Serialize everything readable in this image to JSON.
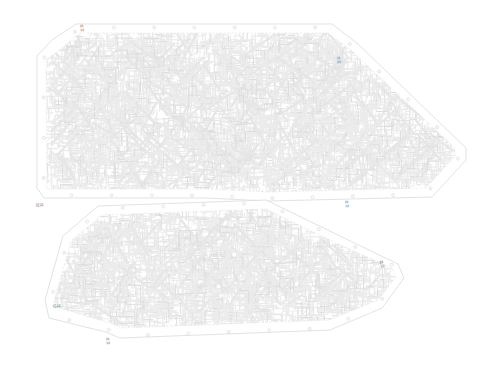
{
  "document": {
    "type": "technical-cad-drawing",
    "subject": "two overlapping chamfered polygon panels with dense routed trace fill",
    "background_color": "#ffffff",
    "width": 481,
    "height": 368
  },
  "palette": {
    "background": "#ffffff",
    "outline": "#d6d6d6",
    "inner_outline": "#e0e0e0",
    "trace_light": "#ebebeb",
    "trace_mid": "#e6e6e6",
    "trace_fine": "#efefef",
    "trace_dark": "#dedede",
    "marker": "#cfcfcf",
    "text": "#8a8a8a"
  },
  "panels": [
    {
      "id": "panel-upper",
      "name": "upper-panel",
      "outline_points": "52,40 76,24 332,24 358,44 466,148 466,160 432,197 268,201 206,198 44,198 37,188 37,56",
      "inner_points": "62,48 80,33 328,33 352,51 455,148 455,156 426,188 268,192 208,189 47,189 46,60",
      "band_markers_count": 26
    },
    {
      "id": "panel-lower",
      "name": "lower-panel",
      "outline_points": "266,200 340,236 398,264 404,278 382,308 330,330 120,338 106,332 49,318 45,300 63,236 98,206",
      "inner_points": "266,209 336,243 392,268 396,277 378,300 329,320 122,328 110,323 56,307 54,301 71,241 102,215",
      "band_markers_count": 20
    }
  ],
  "annotations": [
    {
      "id": "ann-top-left",
      "name": "dimension-label-top-left",
      "line1": "21",
      "line2": "12",
      "x": 82,
      "y": 29,
      "rotation": -4
    },
    {
      "id": "ann-top-right",
      "name": "dimension-label-top-right",
      "line1": "11",
      "line2": "22",
      "x": 339,
      "y": 61,
      "rotation": -4
    },
    {
      "id": "ann-left-mid",
      "name": "dimension-label-left-middle",
      "line1": "21",
      "line2": "11",
      "x": 41,
      "y": 205,
      "rotation": -90
    },
    {
      "id": "ann-mid-right",
      "name": "dimension-label-middle-right",
      "line1": "21",
      "line2": "12",
      "x": 347,
      "y": 205,
      "rotation": -4
    },
    {
      "id": "ann-low-right",
      "name": "dimension-label-lower-right",
      "line1": "22",
      "line2": "11",
      "x": 382,
      "y": 265,
      "rotation": -16
    },
    {
      "id": "ann-low-left",
      "name": "dimension-label-lower-left",
      "line1": "21",
      "line2": "11",
      "x": 58,
      "y": 306,
      "rotation": -90
    },
    {
      "id": "ann-bottom",
      "name": "dimension-label-bottom",
      "line1": "21",
      "line2": "12",
      "x": 108,
      "y": 342,
      "rotation": -4
    }
  ]
}
